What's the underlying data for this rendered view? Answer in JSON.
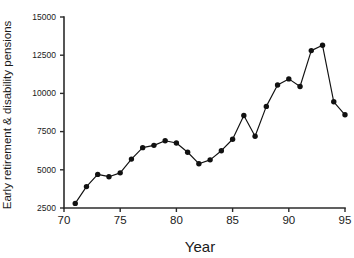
{
  "chart_data": {
    "type": "line",
    "title": "",
    "subtitle": "",
    "xlabel": "Year",
    "ylabel": "Early retirement & disability pensions",
    "xlim": [
      70,
      95
    ],
    "ylim": [
      2500,
      15000
    ],
    "xticks": [
      70,
      75,
      80,
      85,
      90,
      95
    ],
    "xtick_labels": [
      "70",
      "75",
      "80",
      "85",
      "90",
      "95"
    ],
    "yticks": [
      2500,
      5000,
      7500,
      10000,
      12500,
      15000
    ],
    "ytick_labels": [
      "2500",
      "5000",
      "7500",
      "10000",
      "12500",
      "15000"
    ],
    "grid": false,
    "legend": null,
    "marker": "filled-circle",
    "line_color": "#111111",
    "marker_color": "#111111",
    "axis_color": "#2b2b2b",
    "background": "#ffffff",
    "x": [
      71,
      72,
      73,
      74,
      75,
      76,
      77,
      78,
      79,
      80,
      81,
      82,
      83,
      84,
      85,
      86,
      87,
      88,
      89,
      90,
      91,
      92,
      93,
      94,
      95
    ],
    "values": [
      2800,
      3900,
      4700,
      4550,
      4800,
      5700,
      6450,
      6600,
      6900,
      6750,
      6150,
      5400,
      5650,
      6250,
      7000,
      8550,
      7200,
      9150,
      10550,
      10950,
      10450,
      12800,
      13150,
      9450,
      8600
    ],
    "series": [
      {
        "name": "Early retirement & disability pensions",
        "values": [
          2800,
          3900,
          4700,
          4550,
          4800,
          5700,
          6450,
          6600,
          6900,
          6750,
          6150,
          5400,
          5650,
          6250,
          7000,
          8550,
          7200,
          9150,
          10550,
          10950,
          10450,
          12800,
          13150,
          9450,
          8600
        ]
      }
    ]
  }
}
